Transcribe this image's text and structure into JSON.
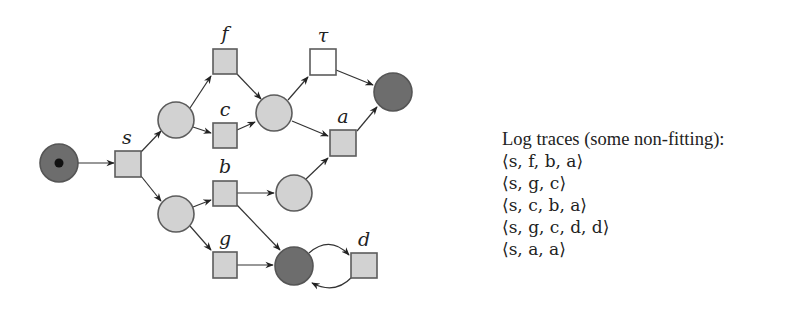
{
  "diagram": {
    "type": "petri-net",
    "colors": {
      "place_light_fill": "#d2d2d2",
      "place_dark_fill": "#6d6d6d",
      "transition_fill": "#d2d2d2",
      "silent_transition_fill": "#ffffff",
      "stroke": "#5c5c5c",
      "token": "#111111"
    },
    "places": [
      {
        "id": "p_start",
        "x": 59,
        "y": 163,
        "r": 19,
        "style": "dark",
        "token": true
      },
      {
        "id": "p1",
        "x": 176,
        "y": 120,
        "r": 18,
        "style": "light"
      },
      {
        "id": "p2",
        "x": 176,
        "y": 214,
        "r": 18,
        "style": "light"
      },
      {
        "id": "p3",
        "x": 274,
        "y": 113,
        "r": 18,
        "style": "light"
      },
      {
        "id": "p4",
        "x": 294,
        "y": 193,
        "r": 18,
        "style": "light"
      },
      {
        "id": "p_end",
        "x": 393,
        "y": 92,
        "r": 19,
        "style": "dark"
      },
      {
        "id": "p_loop",
        "x": 294,
        "y": 266,
        "r": 19,
        "style": "dark"
      }
    ],
    "transitions": [
      {
        "id": "s",
        "label": "s",
        "x": 128,
        "y": 164,
        "silent": false
      },
      {
        "id": "f",
        "label": "f",
        "x": 225,
        "y": 61,
        "silent": false
      },
      {
        "id": "c",
        "label": "c",
        "x": 225,
        "y": 135,
        "silent": false
      },
      {
        "id": "b",
        "label": "b",
        "x": 225,
        "y": 193,
        "silent": false
      },
      {
        "id": "g",
        "label": "g",
        "x": 225,
        "y": 265,
        "silent": false
      },
      {
        "id": "tau",
        "label": "τ",
        "x": 323,
        "y": 62,
        "silent": true
      },
      {
        "id": "a",
        "label": "a",
        "x": 343,
        "y": 143,
        "silent": false
      },
      {
        "id": "d",
        "label": "d",
        "x": 364,
        "y": 265,
        "silent": false
      }
    ]
  },
  "log": {
    "title": "Log traces (some non-fitting):",
    "traces": [
      {
        "text": "⟨s, f, b, a⟩",
        "events": [
          "s",
          "f",
          "b",
          "a"
        ]
      },
      {
        "text": "⟨s, g, c⟩",
        "events": [
          "s",
          "g",
          "c"
        ]
      },
      {
        "text": "⟨s, c, b, a⟩",
        "events": [
          "s",
          "c",
          "b",
          "a"
        ]
      },
      {
        "text": "⟨s, g, c, d, d⟩",
        "events": [
          "s",
          "g",
          "c",
          "d",
          "d"
        ]
      },
      {
        "text": "⟨s, a, a⟩",
        "events": [
          "s",
          "a",
          "a"
        ]
      }
    ]
  }
}
